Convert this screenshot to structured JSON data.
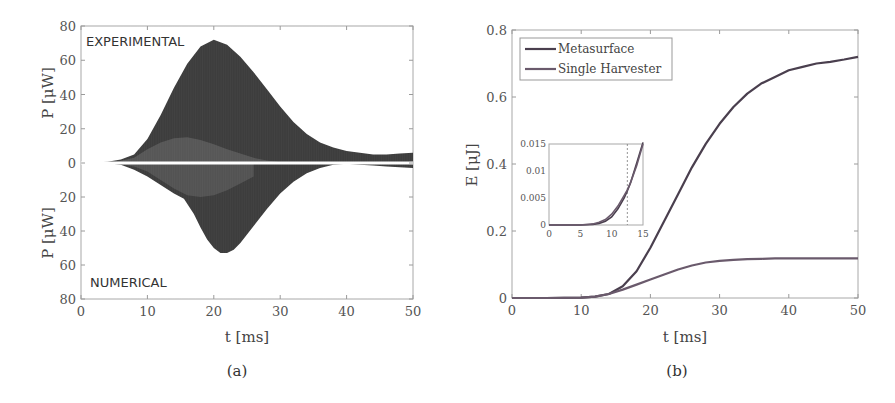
{
  "chart_data": [
    {
      "panel": "a",
      "type": "area",
      "caption": "(a)",
      "xlabel": "t [ms]",
      "ylabel_top": "P [μW]",
      "ylabel_bottom": "P [μW]",
      "xlim": [
        0,
        50
      ],
      "ylim_top": [
        0,
        80
      ],
      "ylim_bottom": [
        0,
        80
      ],
      "xticks": [
        "0",
        "10",
        "20",
        "30",
        "40",
        "50"
      ],
      "yticks_top": [
        "0",
        "20",
        "40",
        "60",
        "80"
      ],
      "yticks_bottom": [
        "20",
        "40",
        "60",
        "80"
      ],
      "grid": false,
      "annotations": {
        "top": "EXPERIMENTAL",
        "bottom": "NUMERICAL"
      },
      "series": [
        {
          "name": "Experimental envelope (upper, mirrored above zero)",
          "x": [
            0,
            2,
            4,
            6,
            8,
            10,
            12,
            14,
            16,
            18,
            20,
            22,
            24,
            26,
            28,
            30,
            32,
            34,
            36,
            38,
            40,
            42,
            44,
            46,
            48,
            50
          ],
          "values": [
            0,
            0.3,
            0.8,
            2,
            5,
            14,
            28,
            44,
            58,
            68,
            72,
            69,
            62,
            53,
            43,
            33,
            24,
            17,
            12,
            9,
            7,
            6,
            5,
            5,
            5.5,
            6
          ]
        },
        {
          "name": "Experimental inner envelope",
          "x": [
            0,
            5,
            8,
            10,
            12,
            14,
            16,
            18,
            20,
            22,
            24,
            26,
            28,
            30,
            32
          ],
          "values": [
            0,
            0.5,
            3,
            8,
            12,
            14.5,
            15,
            13.5,
            11,
            8,
            5.5,
            3,
            1.5,
            0.5,
            0
          ]
        },
        {
          "name": "Numerical envelope (lower, mirrored below zero)",
          "x": [
            0,
            2,
            4,
            6,
            8,
            10,
            12,
            14,
            15.5,
            17,
            18,
            19,
            20,
            21,
            22,
            23,
            24,
            26,
            28,
            30,
            32,
            34,
            36,
            38,
            40,
            42,
            44,
            46,
            48,
            50
          ],
          "values": [
            0,
            0,
            0.2,
            1,
            4,
            8,
            13,
            18,
            21,
            30,
            38,
            45,
            50,
            53,
            53,
            51,
            47,
            37,
            27,
            18,
            11,
            6,
            3,
            1,
            0.5,
            1,
            1.5,
            2,
            2.5,
            3
          ]
        },
        {
          "name": "Numerical inner envelope",
          "x": [
            5,
            8,
            10,
            12,
            14,
            16,
            18,
            20,
            22,
            24,
            26
          ],
          "values": [
            0,
            2,
            5,
            10,
            15,
            19,
            20,
            19,
            16,
            12,
            8
          ]
        }
      ]
    },
    {
      "panel": "b",
      "type": "line",
      "caption": "(b)",
      "xlabel": "t [ms]",
      "ylabel": "E [μJ]",
      "xlim": [
        0,
        50
      ],
      "ylim": [
        0,
        0.8
      ],
      "xticks": [
        "0",
        "10",
        "20",
        "30",
        "40",
        "50"
      ],
      "yticks": [
        "0",
        "0.2",
        "0.4",
        "0.6",
        "0.8"
      ],
      "grid": false,
      "legend_position": "upper left",
      "legend": [
        "Metasurface",
        "Single Harvester"
      ],
      "x": [
        0,
        5,
        10,
        12,
        14,
        16,
        18,
        20,
        22,
        24,
        26,
        28,
        30,
        32,
        34,
        36,
        38,
        40,
        42,
        44,
        46,
        48,
        50
      ],
      "series": [
        {
          "name": "Metasurface",
          "values": [
            0,
            0,
            0.001,
            0.004,
            0.012,
            0.035,
            0.08,
            0.15,
            0.23,
            0.31,
            0.39,
            0.46,
            0.52,
            0.57,
            0.61,
            0.64,
            0.66,
            0.68,
            0.69,
            0.7,
            0.705,
            0.712,
            0.72
          ]
        },
        {
          "name": "Single Harvester",
          "values": [
            0,
            0,
            0.001,
            0.004,
            0.012,
            0.025,
            0.04,
            0.055,
            0.07,
            0.085,
            0.097,
            0.106,
            0.111,
            0.114,
            0.116,
            0.117,
            0.118,
            0.118,
            0.118,
            0.118,
            0.118,
            0.118,
            0.118
          ]
        }
      ],
      "inset": {
        "xlim": [
          0,
          15
        ],
        "ylim": [
          0,
          0.015
        ],
        "xticks": [
          "0",
          "5",
          "10",
          "15"
        ],
        "yticks": [
          "0",
          "0.005",
          "0.01",
          "0.015"
        ],
        "vline_x": 12.5,
        "x": [
          0,
          5,
          7,
          8,
          9,
          10,
          11,
          12,
          12.5,
          13,
          14,
          15
        ],
        "series": [
          {
            "name": "Metasurface",
            "values": [
              0,
              0,
              0.0001,
              0.0003,
              0.0007,
              0.0015,
              0.003,
              0.005,
              0.0063,
              0.0078,
              0.0115,
              0.016
            ]
          },
          {
            "name": "Single Harvester",
            "values": [
              0,
              0,
              0.0002,
              0.0005,
              0.001,
              0.002,
              0.0035,
              0.0055,
              0.0065,
              0.0078,
              0.011,
              0.015
            ]
          }
        ]
      }
    }
  ],
  "colors": {
    "metasurface": "#4a3f4e",
    "single_harvester": "#6a5a6c",
    "fill_dark": "#3d3d3d",
    "fill_light": "#6e6e6e",
    "axis": "#9a9a9a"
  }
}
